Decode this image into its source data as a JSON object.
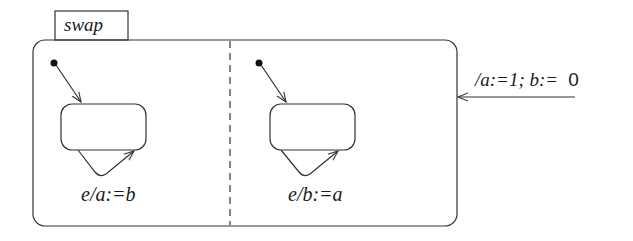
{
  "diagram": {
    "type": "statechart",
    "superstate": {
      "name": "swap",
      "regions": [
        {
          "id": "left",
          "self_transition_label": "e/a:=b"
        },
        {
          "id": "right",
          "self_transition_label": "e/b:=a"
        }
      ]
    },
    "entry_transition": {
      "label_action_italic": "/a:=1; b:=",
      "label_value": "0"
    },
    "colors": {
      "stroke": "#333333",
      "background": "#ffffff"
    }
  }
}
